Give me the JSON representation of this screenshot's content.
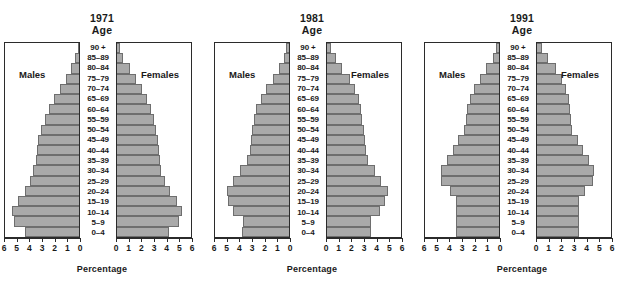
{
  "figure": {
    "axis_title": "Percentage",
    "age_header": "Age",
    "male_label": "Males",
    "female_label": "Females"
  },
  "chart_data": {
    "type": "bar",
    "subtype": "population-pyramid",
    "title": "",
    "xlabel": "Percentage",
    "ylabel": "Age",
    "xlim": [
      0,
      6
    ],
    "male_ticks": [
      6,
      5,
      4,
      3,
      2,
      1,
      0
    ],
    "female_ticks": [
      0,
      1,
      2,
      3,
      4,
      5,
      6
    ],
    "grid": false,
    "legend": "none",
    "categories": [
      "90 +",
      "85–89",
      "80–84",
      "75–79",
      "70–74",
      "65–69",
      "60–64",
      "55–59",
      "50–54",
      "45–49",
      "40–44",
      "35–39",
      "30–34",
      "25–29",
      "20–24",
      "15–19",
      "10–14",
      "5–9",
      "0–4"
    ],
    "panels": [
      {
        "year": "1971",
        "series": [
          {
            "name": "Males",
            "side": "left",
            "values": [
              0.1,
              0.3,
              0.6,
              1.0,
              1.5,
              2.0,
              2.4,
              2.7,
              3.0,
              3.2,
              3.3,
              3.4,
              3.6,
              3.9,
              4.3,
              4.8,
              5.3,
              5.1,
              4.3
            ]
          },
          {
            "name": "Females",
            "side": "right",
            "values": [
              0.2,
              0.5,
              1.0,
              1.5,
              2.0,
              2.4,
              2.7,
              2.9,
              3.1,
              3.2,
              3.3,
              3.4,
              3.5,
              3.8,
              4.2,
              4.7,
              5.1,
              4.9,
              4.1
            ]
          }
        ]
      },
      {
        "year": "1981",
        "series": [
          {
            "name": "Males",
            "side": "left",
            "values": [
              0.2,
              0.4,
              0.8,
              1.3,
              1.8,
              2.2,
              2.6,
              2.8,
              2.9,
              3.0,
              3.1,
              3.3,
              3.9,
              4.4,
              4.9,
              4.8,
              4.4,
              3.6,
              3.7
            ]
          },
          {
            "name": "Females",
            "side": "right",
            "values": [
              0.3,
              0.7,
              1.2,
              1.8,
              2.2,
              2.5,
              2.7,
              2.8,
              2.9,
              3.0,
              3.1,
              3.2,
              3.8,
              4.3,
              4.8,
              4.6,
              4.2,
              3.5,
              3.5
            ]
          }
        ]
      },
      {
        "year": "1991",
        "series": [
          {
            "name": "Males",
            "side": "left",
            "values": [
              0.2,
              0.5,
              1.0,
              1.5,
              2.0,
              2.3,
              2.5,
              2.6,
              2.8,
              3.2,
              3.6,
              4.1,
              4.6,
              4.6,
              3.9,
              3.4,
              3.4,
              3.4,
              3.4
            ]
          },
          {
            "name": "Females",
            "side": "right",
            "values": [
              0.4,
              0.9,
              1.5,
              2.0,
              2.3,
              2.5,
              2.6,
              2.7,
              2.8,
              3.2,
              3.6,
              4.1,
              4.5,
              4.4,
              3.8,
              3.3,
              3.3,
              3.3,
              3.3
            ]
          }
        ]
      }
    ],
    "colors": {
      "bar_fill": "#a9a9a9",
      "bar_edge": "#6e6e6e",
      "frame": "#2b2b2b",
      "text": "#1a1a1a",
      "background": "#ffffff"
    }
  }
}
